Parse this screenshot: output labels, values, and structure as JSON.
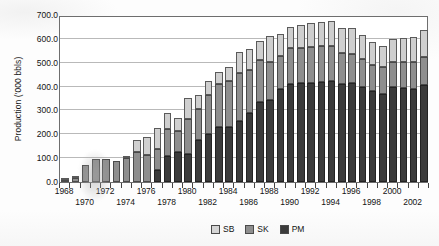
{
  "chart_data": {
    "type": "bar",
    "stacked": true,
    "title": "",
    "xlabel": "",
    "ylabel": "Production ('000 bbls)",
    "ylim": [
      0,
      700
    ],
    "ytick_labels": [
      "700.0",
      "600.0",
      "500.0",
      "400.0",
      "300.0",
      "200.0",
      "100.0",
      "0.0"
    ],
    "ytick_values": [
      700,
      600,
      500,
      400,
      300,
      200,
      100,
      0
    ],
    "grid": true,
    "legend_position": "bottom-right",
    "categories": [
      "1968",
      "1969",
      "1970",
      "1971",
      "1972",
      "1973",
      "1974",
      "1975",
      "1976",
      "1977",
      "1978",
      "1979",
      "1980",
      "1981",
      "1982",
      "1983",
      "1984",
      "1985",
      "1986",
      "1987",
      "1988",
      "1989",
      "1990",
      "1991",
      "1992",
      "1993",
      "1994",
      "1995",
      "1996",
      "1997",
      "1998",
      "1999",
      "2000",
      "2001",
      "2002",
      "2003"
    ],
    "xtick_labels_row1": [
      "1968",
      "1972",
      "1976",
      "1980",
      "1984",
      "1988",
      "1992",
      "1996",
      "2000"
    ],
    "xtick_labels_row2": [
      "1970",
      "1974",
      "1978",
      "1982",
      "1986",
      "1990",
      "1994",
      "1998",
      "2002"
    ],
    "series": [
      {
        "name": "PM",
        "color": "#3b3b3b",
        "values": [
          0,
          0,
          0,
          0,
          0,
          0,
          0,
          0,
          0,
          50,
          110,
          125,
          118,
          175,
          200,
          230,
          232,
          255,
          290,
          335,
          345,
          390,
          410,
          415,
          415,
          420,
          425,
          410,
          415,
          400,
          380,
          370,
          400,
          395,
          390,
          405
        ]
      },
      {
        "name": "SK",
        "color": "#8e8e8e",
        "values": [
          10,
          18,
          70,
          98,
          98,
          90,
          100,
          125,
          115,
          90,
          112,
          90,
          148,
          130,
          165,
          180,
          190,
          200,
          178,
          175,
          160,
          140,
          150,
          148,
          150,
          150,
          145,
          130,
          122,
          115,
          110,
          112,
          105,
          108,
          112,
          118
        ]
      },
      {
        "name": "SB",
        "color": "#cfcfcf",
        "values": [
          2,
          3,
          0,
          0,
          0,
          0,
          5,
          50,
          75,
          85,
          68,
          55,
          85,
          58,
          58,
          50,
          60,
          90,
          88,
          82,
          105,
          90,
          90,
          95,
          100,
          100,
          105,
          105,
          110,
          100,
          95,
          90,
          95,
          100,
          105,
          115
        ]
      }
    ],
    "legend_entries": [
      {
        "label": "SB",
        "color": "#d5d5d5"
      },
      {
        "label": "SK",
        "color": "#8e8e8e"
      },
      {
        "label": "PM",
        "color": "#3b3b3b"
      }
    ]
  }
}
